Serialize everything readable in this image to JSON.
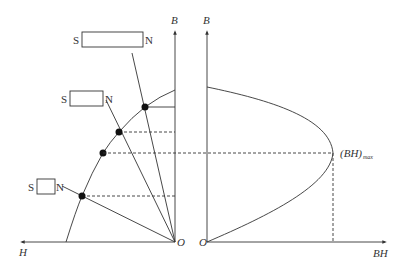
{
  "diagram": {
    "left_panel": {
      "axis_h_label": "H",
      "axis_b_label": "B",
      "origin_label": "O",
      "magnets": [
        {
          "south": "S",
          "north": "N",
          "size": "long"
        },
        {
          "south": "S",
          "north": "N",
          "size": "medium"
        },
        {
          "south": "S",
          "north": "N",
          "size": "short"
        }
      ],
      "curve": "demagnetization curve (second quadrant)",
      "operating_points": 4
    },
    "right_panel": {
      "axis_b_label": "B",
      "axis_bh_label": "BH",
      "origin_label": "O",
      "max_label": "(BH)",
      "max_subscript": "max",
      "curve": "energy product curve"
    },
    "colors": {
      "line": "#333333",
      "background": "#ffffff"
    }
  }
}
